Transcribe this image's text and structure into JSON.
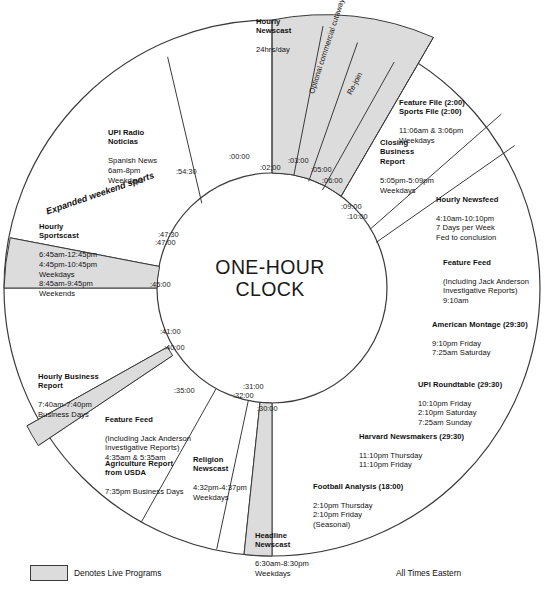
{
  "title": "ONE-HOUR CLOCK",
  "title_line1": "ONE-HOUR",
  "title_line2": "CLOCK",
  "legend": {
    "swatch_label": "Denotes Live Programs",
    "footer_note": "All Times Eastern"
  },
  "colors": {
    "live_fill": "#dcdcdc",
    "outline": "#3a3a3a",
    "text": "#111111",
    "background": "#ffffff"
  },
  "ticks": [
    {
      "label": ":00:00"
    },
    {
      "label": ":02:00"
    },
    {
      "label": ":03:00"
    },
    {
      "label": ":05:00"
    },
    {
      "label": ":06:00"
    },
    {
      "label": ":09:00"
    },
    {
      "label": ":10:00"
    },
    {
      "label": ":30:00"
    },
    {
      "label": ":31:00"
    },
    {
      "label": ":32:00"
    },
    {
      "label": ":35:00"
    },
    {
      "label": ":40:00"
    },
    {
      "label": ":41:00"
    },
    {
      "label": ":45:00"
    },
    {
      "label": ":47:00"
    },
    {
      "label": ":47:30"
    },
    {
      "label": ":54:30"
    }
  ],
  "rotated_labels": [
    {
      "text": "Optional commercial\ncutaway or end of cast"
    },
    {
      "text": "Re-join"
    },
    {
      "text": "Expanded weekend sports"
    }
  ],
  "programs": [
    {
      "id": "hourly-newscast",
      "heading": "Hourly\nNewscast",
      "body": "24hrs/day",
      "live": true
    },
    {
      "id": "feature-file-sports-file",
      "heading": "Feature File (2:00)\nSports File (2:00)",
      "body": "11:06am & 3:06pm\nWeekdays",
      "live": false
    },
    {
      "id": "closing-business-report",
      "heading": "Closing\nBusiness\nReport",
      "body": "5:05pm-5:09pm\nWeekdays",
      "live": false
    },
    {
      "id": "hourly-newsfeed",
      "heading": "Hourly Newsfeed",
      "body": "4:10am-10:10pm\n7 Days per Week\nFed to conclusion",
      "live": false
    },
    {
      "id": "feature-feed-morning",
      "heading": "Feature Feed",
      "body": "(Including Jack Anderson\nInvestigative Reports)\n9:10am",
      "live": false
    },
    {
      "id": "american-montage",
      "heading": "American Montage (29:30)",
      "body": "9:10pm Friday\n7:25am Saturday",
      "live": false
    },
    {
      "id": "upi-roundtable",
      "heading": "UPI Roundtable (29:30)",
      "body": "10:10pm Friday\n2:10pm Saturday\n7:25am Sunday",
      "live": false
    },
    {
      "id": "harvard-newsmakers",
      "heading": "Harvard Newsmakers (29:30)",
      "body": "11:10pm Thursday\n11:10pm Friday",
      "live": false
    },
    {
      "id": "football-analysis",
      "heading": "Football Analysis (18:00)",
      "body": "2:10pm Thursday\n2:10pm Friday\n(Seasonal)",
      "live": false
    },
    {
      "id": "headline-newscast",
      "heading": "Headline\nNewscast",
      "body": "6:30am-8:30pm\nWeekdays",
      "live": true
    },
    {
      "id": "religion-newscast",
      "heading": "Religion\nNewscast",
      "body": "4:32pm-4:37pm\nWeekdays",
      "live": false
    },
    {
      "id": "agriculture-report",
      "heading": "Agriculture Report\nfrom USDA",
      "body": "7:35pm Business Days",
      "live": false
    },
    {
      "id": "feature-feed-early",
      "heading": "Feature Feed",
      "body": "(Including Jack Anderson\nInvestigative Reports)\n4:35am & 5:35am",
      "live": false
    },
    {
      "id": "hourly-business-report",
      "heading": "Hourly Business\nReport",
      "body": "7:40am-7:40pm\nBusiness Days",
      "live": true
    },
    {
      "id": "hourly-sportscast",
      "heading": "Hourly\nSportscast",
      "body": "6:45am-12:45pm\n4:45pm-10:45pm\nWeekdays\n8:45am-9:45pm\nWeekends",
      "live": true
    },
    {
      "id": "upi-radio-noticias",
      "heading": "UPI Radio\nNoticias",
      "body": "Spanish News\n6am-8pm\nWeekdays",
      "live": false
    }
  ]
}
